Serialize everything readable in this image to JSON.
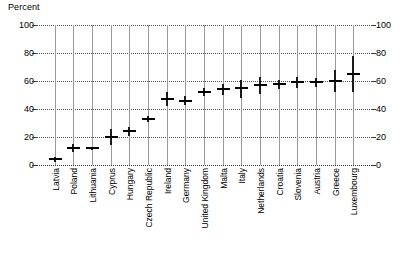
{
  "chart_data": {
    "type": "scatter",
    "title": "",
    "subtitle": "",
    "unit_label": "Percent",
    "xlabel": "",
    "ylabel": "Percent",
    "ylim": [
      0,
      100
    ],
    "yticks": [
      0,
      20,
      40,
      60,
      80,
      100
    ],
    "ytick_labels_left": [
      "100",
      "80",
      "60",
      "40",
      "20",
      "0"
    ],
    "ytick_labels_right": [
      "100",
      "80",
      "60",
      "40",
      "20",
      "0"
    ],
    "grid": "both",
    "legend": "none",
    "axis_right_mirrored": true,
    "categories": [
      "Latvia",
      "Poland",
      "Lithuania",
      "Cyprus",
      "Hungary",
      "Czech Republic",
      "Ireland",
      "Germany",
      "United Kingdom",
      "Malta",
      "Italy",
      "Netherlands",
      "Croatia",
      "Slovenia",
      "Austria",
      "Greece",
      "Luxembourg"
    ],
    "values": [
      4,
      12,
      12,
      20,
      24,
      33,
      47,
      46,
      52,
      54,
      55,
      57,
      58,
      59,
      59,
      60,
      65
    ],
    "low": [
      2,
      9,
      11,
      14,
      21,
      31,
      42,
      43,
      49,
      50,
      48,
      51,
      54,
      55,
      56,
      52,
      52
    ],
    "high": [
      6,
      15,
      13,
      26,
      27,
      35,
      52,
      49,
      55,
      58,
      61,
      63,
      61,
      63,
      62,
      68,
      78
    ],
    "series": [
      {
        "name": "Estimate with uncertainty interval",
        "values": [
          4,
          12,
          12,
          20,
          24,
          33,
          47,
          46,
          52,
          54,
          55,
          57,
          58,
          59,
          59,
          60,
          65
        ]
      }
    ],
    "marker": "horizontal-bar-with-vertical-range-line",
    "colors": {
      "marker": "#000000",
      "gridline_vertical": "#9a9a9a",
      "gridline_horizontal": "#555555",
      "background": "#ffffff",
      "text": "#000000"
    }
  }
}
